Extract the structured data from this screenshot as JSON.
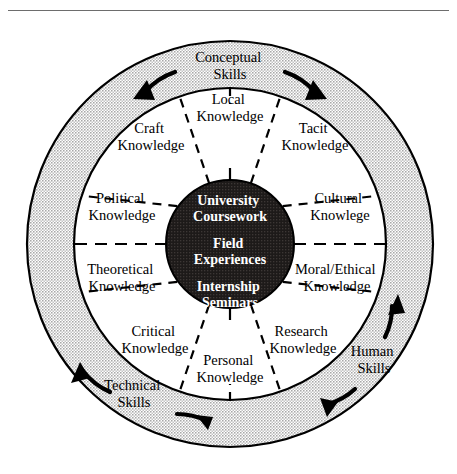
{
  "figure": {
    "title_fragment": "",
    "type": "concentric-circle-diagram",
    "geometry": {
      "center_x": 230,
      "center_y": 244,
      "outer_radius": 203,
      "mid_radius": 156,
      "core_radius": 64
    },
    "colors": {
      "outer_ring_fill": "#d9d9d9",
      "inner_ring_fill": "#ffffff",
      "core_fill": "#231f1e",
      "core_text": "#ffffff",
      "stroke": "#000000",
      "rule": "#6d6d6d"
    }
  },
  "outer_ring": {
    "name": "skills-ring",
    "labels": [
      {
        "id": "conceptual",
        "line1": "Conceptual",
        "line2": "Skills",
        "x": 230,
        "y": 62,
        "arrows": 2
      },
      {
        "id": "human",
        "line1": "Human",
        "line2": "Skills",
        "x": 374,
        "y": 356,
        "arrows": 2
      },
      {
        "id": "technical",
        "line1": "Technical",
        "line2": "Skills",
        "x": 134,
        "y": 390,
        "arrows": 2
      }
    ]
  },
  "inner_ring": {
    "name": "knowledge-ring",
    "sector_count": 10,
    "sectors": [
      {
        "id": "local",
        "line1": "Local",
        "line2": "Knowledge",
        "x": 230,
        "y": 108
      },
      {
        "id": "tacit",
        "line1": "Tacit",
        "line2": "Knowledge",
        "x": 313,
        "y": 133
      },
      {
        "id": "cultural",
        "line1": "Cultural",
        "line2": "Knowlege",
        "x": 339,
        "y": 202
      },
      {
        "id": "moral",
        "line1": "Moral/Ethical",
        "line2": "Knowledge",
        "x": 335,
        "y": 272
      },
      {
        "id": "research",
        "line1": "Research",
        "line2": "Knowledge",
        "x": 302,
        "y": 335
      },
      {
        "id": "personal",
        "line1": "Personal",
        "line2": "Knowledge",
        "x": 230,
        "y": 366
      },
      {
        "id": "critical",
        "line1": "Critical",
        "line2": "Knowledge",
        "x": 154,
        "y": 335
      },
      {
        "id": "theoretical",
        "line1": "Theoretical",
        "line2": "Knowledge",
        "x": 121,
        "y": 272
      },
      {
        "id": "political",
        "line1": "Political",
        "line2": "Knowledge",
        "x": 121,
        "y": 202
      },
      {
        "id": "craft",
        "line1": "Craft",
        "line2": "Knowledge",
        "x": 150,
        "y": 133
      }
    ]
  },
  "core": {
    "name": "program-core",
    "lines": [
      {
        "id": "university-coursework",
        "line1": "University",
        "line2": "Coursework"
      },
      {
        "id": "field-experiences",
        "line1": "Field",
        "line2": "Experiences"
      },
      {
        "id": "internship-seminars",
        "line1": "Internship",
        "line2": "Seminars"
      }
    ]
  }
}
